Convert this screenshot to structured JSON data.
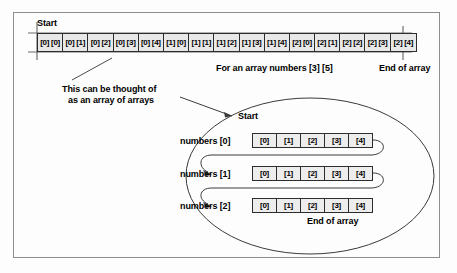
{
  "figure": {
    "title_alt": "Two-dimensional array memory layout diagram",
    "border_color": "#8d8d8d",
    "cell_fill": "#e8e8e8",
    "line_color": "#2d2d2d"
  },
  "top_section": {
    "start_label": "Start",
    "end_label": "End of array",
    "caption": "For an array numbers [3] [5]",
    "cells": [
      "[0] [0]",
      "[0] [1]",
      "[0] [2]",
      "[0] [3]",
      "[0] [4]",
      "[1] [0]",
      "[1] [1]",
      "[1] [2]",
      "[1] [3]",
      "[1] [4]",
      "[2] [0]",
      "[2] [1]",
      "[2] [2]",
      "[2] [3]",
      "[2] [4]"
    ]
  },
  "annotation": {
    "line1": "This can be thought of",
    "line2": "as an array of arrays"
  },
  "bottom_section": {
    "start_label": "Start",
    "end_label": "End of array",
    "rows": [
      {
        "label": "numbers [0]",
        "cells": [
          "[0]",
          "[1]",
          "[2]",
          "[3]",
          "[4]"
        ]
      },
      {
        "label": "numbers [1]",
        "cells": [
          "[0]",
          "[1]",
          "[2]",
          "[3]",
          "[4]"
        ]
      },
      {
        "label": "numbers [2]",
        "cells": [
          "[0]",
          "[1]",
          "[2]",
          "[3]",
          "[4]"
        ]
      }
    ]
  }
}
